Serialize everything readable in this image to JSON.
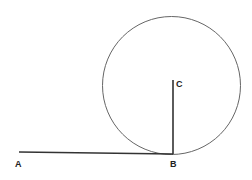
{
  "diagram": {
    "type": "geometry",
    "points": {
      "A": {
        "label": "A",
        "x": 19,
        "y": 152
      },
      "B": {
        "label": "B",
        "x": 173,
        "y": 154
      },
      "C": {
        "label": "C",
        "x": 173,
        "y": 80
      }
    },
    "circle": {
      "cx": 171.5,
      "cy": 85.5,
      "r": 69,
      "stroke": "#666666"
    },
    "segments": [
      {
        "from": "A",
        "to": "B",
        "stroke": "#333333"
      },
      {
        "from": "C",
        "to": "B",
        "stroke": "#333333"
      }
    ]
  }
}
